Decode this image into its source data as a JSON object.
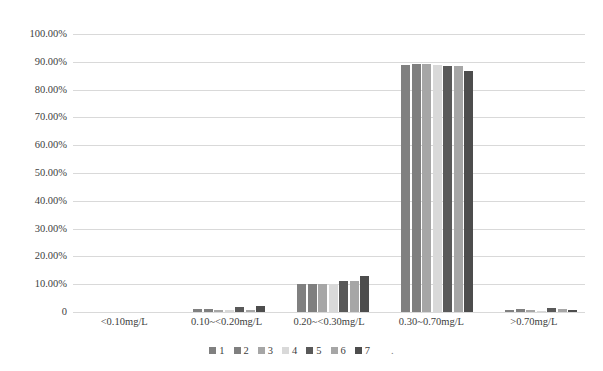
{
  "chart_data": {
    "type": "bar",
    "title": "",
    "xlabel": "",
    "ylabel": "",
    "grid": true,
    "legend_position": "bottom",
    "ylim": [
      0,
      100
    ],
    "ytick_labels": [
      "100.00%",
      "90.00%",
      "80.00%",
      "70.00%",
      "60.00%",
      "50.00%",
      "40.00%",
      "30.00%",
      "20.00%",
      "10.00%",
      "0"
    ],
    "ytick_values": [
      100,
      90,
      80,
      70,
      60,
      50,
      40,
      30,
      20,
      10,
      0
    ],
    "categories": [
      "<0.10mg/L",
      "0.10~<0.20mg/L",
      "0.20~<0.30mg/L",
      "0.30~0.70mg/L",
      ">0.70mg/L"
    ],
    "series": [
      {
        "name": "1",
        "color": "#808080",
        "values": [
          0.0,
          1.0,
          10.0,
          89.0,
          0.9
        ]
      },
      {
        "name": "2",
        "color": "#7f7f7f",
        "values": [
          0.0,
          1.1,
          10.1,
          89.1,
          1.0
        ]
      },
      {
        "name": "3",
        "color": "#a6a6a6",
        "values": [
          0.0,
          0.8,
          10.2,
          89.2,
          0.8
        ]
      },
      {
        "name": "4",
        "color": "#d9d9d9",
        "values": [
          0.0,
          0.6,
          10.0,
          89.0,
          0.5
        ]
      },
      {
        "name": "5",
        "color": "#595959",
        "values": [
          0.0,
          1.8,
          11.0,
          88.5,
          1.4
        ]
      },
      {
        "name": "6",
        "color": "#a6a6a6",
        "values": [
          0.0,
          0.9,
          11.2,
          88.4,
          1.0
        ]
      },
      {
        "name": "7",
        "color": "#4d4d4d",
        "values": [
          0.0,
          2.1,
          12.8,
          86.6,
          0.7
        ]
      }
    ],
    "legend_entries": [
      "1",
      "2",
      "3",
      "4",
      "5",
      "6",
      "7"
    ],
    "legend_trailing_text": "."
  },
  "colors": {
    "background": "#ffffff",
    "gridline": "#d9d9d9",
    "text": "#404040"
  }
}
